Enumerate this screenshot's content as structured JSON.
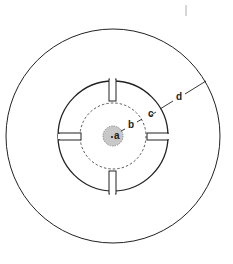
{
  "diagram": {
    "type": "concentric-circles",
    "center": [
      113,
      136
    ],
    "circles": {
      "outer": {
        "radius": 107,
        "style": "solid"
      },
      "inner": {
        "radius": 55,
        "style": "solid"
      },
      "dashed": {
        "radius": 33,
        "style": "dashed"
      },
      "core": {
        "radius": 10,
        "style": "dashed",
        "fill": "#c8c8c8"
      }
    },
    "spokes": 4,
    "labels": {
      "a": "a",
      "b": "b",
      "c": "c",
      "d": "d"
    },
    "colors": {
      "line": "#222222",
      "core_fill": "#c8c8c8",
      "artifact": "#bbbbbb"
    }
  }
}
